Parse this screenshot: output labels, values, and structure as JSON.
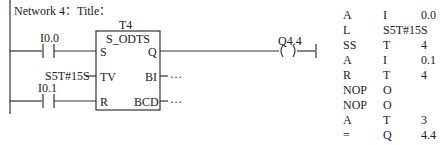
{
  "network": {
    "title": "Network 4：Title："
  },
  "ladder": {
    "timer_id": "T4",
    "block_type": "S_ODTS",
    "pins": {
      "s": "S",
      "tv": "TV",
      "r": "R",
      "q": "Q",
      "bi": "BI",
      "bcd": "BCD"
    },
    "contact_set": "I0.0",
    "contact_reset": "I0.1",
    "tv_value": "S5T#15S",
    "bi_output": "…",
    "bcd_output": "…",
    "coil": "Q4.4"
  },
  "stl": [
    {
      "op": "A",
      "type": "I",
      "addr": "0.0"
    },
    {
      "op": "L",
      "type": "S5T#15S",
      "addr": ""
    },
    {
      "op": "SS",
      "type": "T",
      "addr": "4"
    },
    {
      "op": "A",
      "type": "I",
      "addr": "0.1"
    },
    {
      "op": "R",
      "type": "T",
      "addr": "4"
    },
    {
      "op": "NOP",
      "type": "O",
      "addr": ""
    },
    {
      "op": "NOP",
      "type": "O",
      "addr": ""
    },
    {
      "op": "A",
      "type": "T",
      "addr": "3"
    },
    {
      "op": "=",
      "type": "Q",
      "addr": "4.4"
    }
  ]
}
